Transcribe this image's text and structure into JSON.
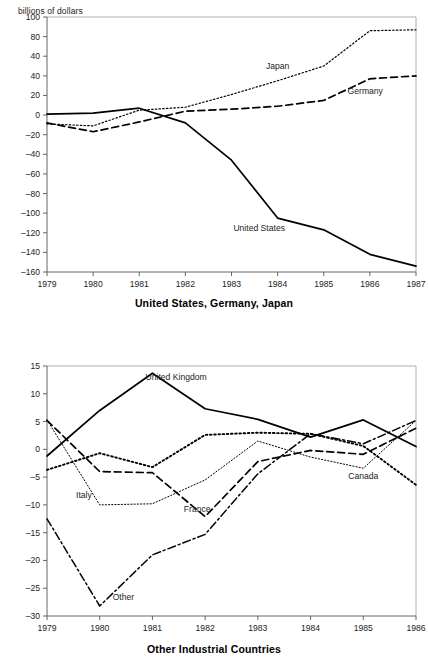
{
  "document": {
    "kind": "two-panel line chart figure"
  },
  "chart_data": [
    {
      "id": "top",
      "type": "line",
      "title": "",
      "caption": "United States, Germany, Japan",
      "ylabel": "billions of dollars",
      "xlabel": "",
      "categories": [
        "1979",
        "1980",
        "1981",
        "1982",
        "1983",
        "1984",
        "1985",
        "1986",
        "1987"
      ],
      "x": [
        1979,
        1980,
        1981,
        1982,
        1983,
        1984,
        1985,
        1986,
        1987
      ],
      "ylim": [
        -160,
        100
      ],
      "yticks": [
        100,
        80,
        60,
        40,
        20,
        0,
        -20,
        -40,
        -60,
        -80,
        -100,
        -120,
        -140,
        -160
      ],
      "ytick_labels": [
        "100",
        "80",
        "40",
        "40",
        "20",
        "0",
        "–20",
        "–40",
        "–60",
        "–80",
        "–100",
        "–120",
        "–140",
        "–160"
      ],
      "grid": false,
      "legend_position": "inline-annotations",
      "series": [
        {
          "name": "United States",
          "style": "solid",
          "label_x": 1983.6,
          "label_y": -118,
          "values": [
            1,
            2,
            7,
            -8,
            -46,
            -105,
            -117,
            -142,
            -154
          ]
        },
        {
          "name": "Germany",
          "style": "dashed",
          "label_x": 1985.9,
          "label_y": 22,
          "values": [
            -8,
            -17,
            -7,
            4,
            6,
            9,
            15,
            37,
            40
          ]
        },
        {
          "name": "Japan",
          "style": "dotted",
          "label_x": 1984.0,
          "label_y": 47,
          "values": [
            -9,
            -11,
            5,
            8,
            21,
            35,
            50,
            86,
            87
          ]
        }
      ]
    },
    {
      "id": "bottom",
      "type": "line",
      "title": "",
      "caption": "Other Industrial Countries",
      "ylabel": "",
      "xlabel": "",
      "categories": [
        "1979",
        "1980",
        "1981",
        "1982",
        "1983",
        "1984",
        "1985",
        "1986"
      ],
      "x": [
        1979,
        1980,
        1981,
        1982,
        1983,
        1984,
        1985,
        1986
      ],
      "ylim": [
        -30,
        15
      ],
      "yticks": [
        15,
        10,
        5,
        0,
        -5,
        -10,
        -15,
        -20,
        -25,
        -30
      ],
      "ytick_labels": [
        "15",
        "10",
        "5",
        "0",
        "–5",
        "–10",
        "–15",
        "–20",
        "–25",
        "–30"
      ],
      "grid": false,
      "legend_position": "inline-annotations",
      "series": [
        {
          "name": "United Kingdom",
          "style": "solid",
          "label_x": 1981.45,
          "label_y": 12.4,
          "values": [
            -1.2,
            7.0,
            13.7,
            7.3,
            5.4,
            2.2,
            5.3,
            0.5
          ]
        },
        {
          "name": "Canada",
          "style": "bold-dotted",
          "label_x": 1985.0,
          "label_y": -5.4,
          "values": [
            -3.7,
            -0.7,
            -3.2,
            2.6,
            3.0,
            2.8,
            0.6,
            -6.4
          ]
        },
        {
          "name": "France",
          "style": "dashed",
          "label_x": 1981.85,
          "label_y": -11.2,
          "values": [
            5.2,
            -4.0,
            -4.2,
            -12.1,
            -2.2,
            -0.2,
            -0.9,
            3.8
          ]
        },
        {
          "name": "Italy",
          "style": "fine-dotted",
          "label_x": 1979.7,
          "label_y": -8.8,
          "values": [
            5.3,
            -10.0,
            -9.8,
            -5.5,
            1.5,
            -1.4,
            -3.4,
            5.2
          ]
        },
        {
          "name": "Other",
          "style": "dash-dot",
          "label_x": 1980.45,
          "label_y": -27.2,
          "values": [
            -12.5,
            -28.2,
            -19.0,
            -15.3,
            -4.4,
            2.8,
            1.0,
            5.2
          ]
        }
      ]
    }
  ]
}
